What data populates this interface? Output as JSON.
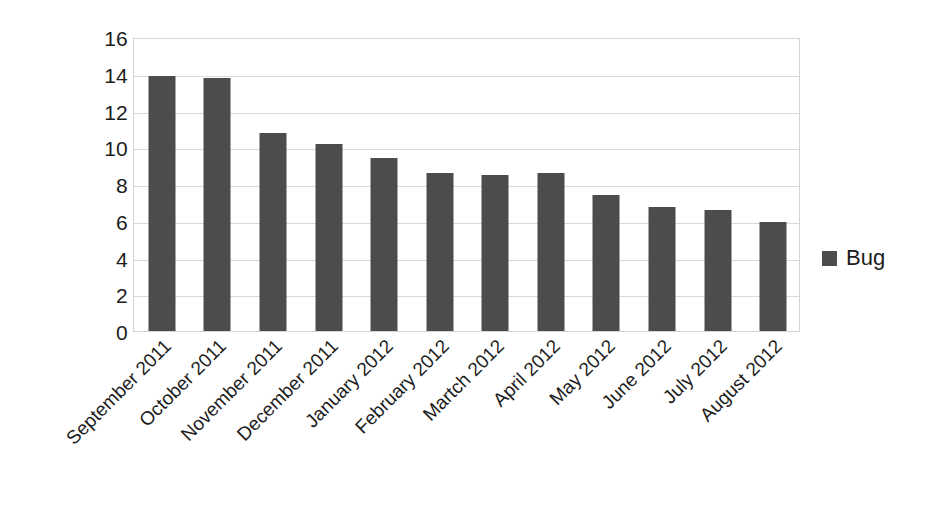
{
  "chart_data": {
    "type": "bar",
    "title": "",
    "subtitle": "",
    "xlabel": "",
    "ylabel": "",
    "categories": [
      "September 2011",
      "October 2011",
      "November 2011",
      "December 2011",
      "January 2012",
      "February 2012",
      "Martch 2012",
      "April 2012",
      "May 2012",
      "June 2012",
      "July 2012",
      "August 2012"
    ],
    "series": [
      {
        "name": "Bug",
        "color": "#4c4c4c",
        "values": [
          13.9,
          13.75,
          10.8,
          10.2,
          9.4,
          8.6,
          8.5,
          8.6,
          7.4,
          6.75,
          6.6,
          5.95
        ]
      }
    ],
    "values": [
      13.9,
      13.75,
      10.8,
      10.2,
      9.4,
      8.6,
      8.5,
      8.6,
      7.4,
      6.75,
      6.6,
      5.95
    ],
    "ylim": [
      0,
      16
    ],
    "ytick_labels": [
      "16",
      "14",
      "12",
      "10",
      "8",
      "6",
      "4",
      "2",
      "0"
    ],
    "ytick_values": [
      16,
      14,
      12,
      10,
      8,
      6,
      4,
      2,
      0
    ],
    "grid": true,
    "grid_axis": "y",
    "legend_position": "right",
    "legend_entries": [
      {
        "label": "Bug",
        "color": "#4c4c4c",
        "swatch_icon": "filled-square-icon"
      }
    ],
    "x_label_rotation_degrees": -45,
    "plot_background": "#ffffff",
    "plot_border_color": "#d4d4d4",
    "gridline_color": "#d9d9d9",
    "text_color": "#1c1c1c"
  }
}
